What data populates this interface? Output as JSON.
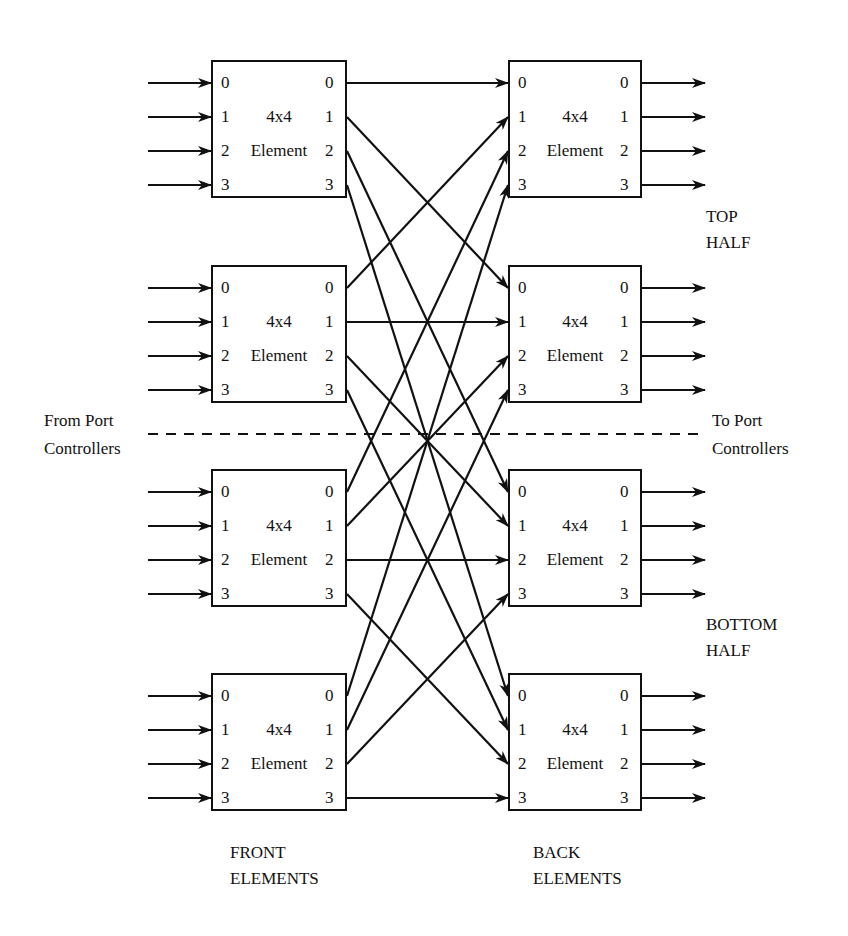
{
  "diagram": {
    "type": "two-stage 16x16 switching network (delta)",
    "element_label_line1": "4x4",
    "element_label_line2": "Element",
    "port_labels": [
      "0",
      "1",
      "2",
      "3"
    ],
    "front_elements": [
      {
        "id": "F0",
        "label": "4x4 Element",
        "inputs": [
          "0",
          "1",
          "2",
          "3"
        ],
        "outputs": [
          "0",
          "1",
          "2",
          "3"
        ]
      },
      {
        "id": "F1",
        "label": "4x4 Element",
        "inputs": [
          "0",
          "1",
          "2",
          "3"
        ],
        "outputs": [
          "0",
          "1",
          "2",
          "3"
        ]
      },
      {
        "id": "F2",
        "label": "4x4 Element",
        "inputs": [
          "0",
          "1",
          "2",
          "3"
        ],
        "outputs": [
          "0",
          "1",
          "2",
          "3"
        ]
      },
      {
        "id": "F3",
        "label": "4x4 Element",
        "inputs": [
          "0",
          "1",
          "2",
          "3"
        ],
        "outputs": [
          "0",
          "1",
          "2",
          "3"
        ]
      }
    ],
    "back_elements": [
      {
        "id": "B0",
        "label": "4x4 Element",
        "inputs": [
          "0",
          "1",
          "2",
          "3"
        ],
        "outputs": [
          "0",
          "1",
          "2",
          "3"
        ]
      },
      {
        "id": "B1",
        "label": "4x4 Element",
        "inputs": [
          "0",
          "1",
          "2",
          "3"
        ],
        "outputs": [
          "0",
          "1",
          "2",
          "3"
        ]
      },
      {
        "id": "B2",
        "label": "4x4 Element",
        "inputs": [
          "0",
          "1",
          "2",
          "3"
        ],
        "outputs": [
          "0",
          "1",
          "2",
          "3"
        ]
      },
      {
        "id": "B3",
        "label": "4x4 Element",
        "inputs": [
          "0",
          "1",
          "2",
          "3"
        ],
        "outputs": [
          "0",
          "1",
          "2",
          "3"
        ]
      }
    ],
    "connections_rule": "front element i output j -> back element j input i",
    "labels": {
      "from_line1": "From Port",
      "from_line2": "Controllers",
      "to_line1": "To Port",
      "to_line2": "Controllers",
      "top_line1": "TOP",
      "top_line2": "HALF",
      "bottom_line1": "BOTTOM",
      "bottom_line2": "HALF",
      "front_line1": "FRONT",
      "front_line2": "ELEMENTS",
      "back_line1": "BACK",
      "back_line2": "ELEMENTS"
    },
    "colors": {
      "line": "#111111",
      "background": "#ffffff"
    }
  }
}
